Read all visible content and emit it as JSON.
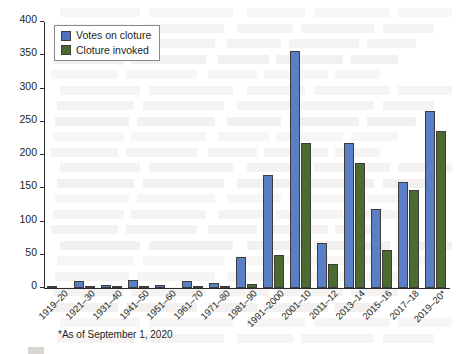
{
  "chart_data": {
    "type": "bar",
    "title": "",
    "xlabel": "",
    "ylabel": "",
    "ylim": [
      0,
      400
    ],
    "yticks": [
      0,
      50,
      100,
      150,
      200,
      250,
      300,
      350,
      400
    ],
    "grid": false,
    "legend_position": "top-left",
    "categories": [
      "1919–20",
      "1921–30",
      "1931–40",
      "1941–50",
      "1951–60",
      "1961–70",
      "1971–80",
      "1981–90",
      "1991–2000",
      "2001–10",
      "2011–12",
      "2013–14",
      "2015–16",
      "2017–18",
      "2019–20*"
    ],
    "series": [
      {
        "name": "Votes on cloture",
        "color": "#5b7fc4",
        "values": [
          3,
          11,
          5,
          12,
          4,
          11,
          8,
          47,
          170,
          357,
          68,
          218,
          119,
          159,
          266
        ]
      },
      {
        "name": "Cloture invoked",
        "color": "#4b6b31",
        "values": [
          0,
          3,
          1,
          1,
          0,
          1,
          1,
          6,
          50,
          218,
          36,
          188,
          57,
          147,
          236
        ]
      }
    ],
    "annotations": [
      "*As of September 1, 2020"
    ]
  },
  "legend": {
    "items": [
      {
        "label": "Votes on cloture",
        "swatch": "votes"
      },
      {
        "label": "Cloture invoked",
        "swatch": "invoked"
      }
    ]
  },
  "footnote": {
    "text": "*As of September 1, 2020"
  }
}
